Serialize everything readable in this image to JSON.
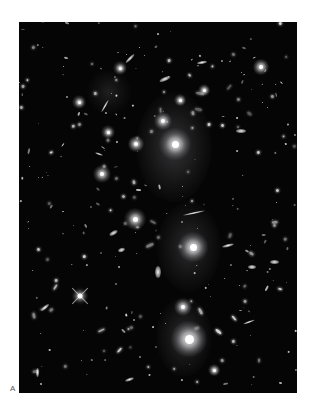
{
  "figure": {
    "panel_label": "A",
    "background_color": "#050505",
    "image_box": {
      "left": 19,
      "top": 22,
      "width": 278,
      "height": 371
    }
  },
  "diffuse_light": [
    {
      "x": 155,
      "y": 125,
      "rx": 38,
      "ry": 55,
      "opacity": 0.22
    },
    {
      "x": 170,
      "y": 225,
      "rx": 32,
      "ry": 45,
      "opacity": 0.18
    },
    {
      "x": 165,
      "y": 315,
      "rx": 28,
      "ry": 40,
      "opacity": 0.18
    },
    {
      "x": 90,
      "y": 70,
      "rx": 22,
      "ry": 22,
      "opacity": 0.12
    }
  ],
  "bright_galaxies": [
    {
      "x": 156,
      "y": 122,
      "r": 7,
      "glow": 16
    },
    {
      "x": 144,
      "y": 99,
      "r": 4,
      "glow": 9
    },
    {
      "x": 174,
      "y": 225,
      "r": 7,
      "glow": 15
    },
    {
      "x": 170,
      "y": 317,
      "r": 9,
      "glow": 18
    },
    {
      "x": 164,
      "y": 285,
      "r": 4,
      "glow": 9
    },
    {
      "x": 116,
      "y": 197,
      "r": 5,
      "glow": 11
    },
    {
      "x": 83,
      "y": 152,
      "r": 4,
      "glow": 9
    },
    {
      "x": 101,
      "y": 46,
      "r": 3,
      "glow": 7
    },
    {
      "x": 60,
      "y": 80,
      "r": 3,
      "glow": 7
    },
    {
      "x": 242,
      "y": 45,
      "r": 4,
      "glow": 8
    },
    {
      "x": 161,
      "y": 78,
      "r": 3,
      "glow": 6
    },
    {
      "x": 185,
      "y": 68,
      "r": 3,
      "glow": 6
    },
    {
      "x": 195,
      "y": 348,
      "r": 3,
      "glow": 6
    },
    {
      "x": 89,
      "y": 110,
      "r": 3,
      "glow": 7
    },
    {
      "x": 117,
      "y": 122,
      "r": 4,
      "glow": 8
    }
  ],
  "elongated_galaxies": [
    {
      "x": 146,
      "y": 57,
      "w": 12,
      "h": 4,
      "angle": -25
    },
    {
      "x": 183,
      "y": 40,
      "w": 10,
      "h": 3,
      "angle": -10
    },
    {
      "x": 111,
      "y": 36,
      "w": 12,
      "h": 3,
      "angle": -45
    },
    {
      "x": 86,
      "y": 84,
      "w": 14,
      "h": 2,
      "angle": -60
    },
    {
      "x": 222,
      "y": 109,
      "w": 10,
      "h": 4,
      "angle": 0
    },
    {
      "x": 175,
      "y": 191,
      "w": 22,
      "h": 2,
      "angle": -12
    },
    {
      "x": 139,
      "y": 250,
      "w": 6,
      "h": 12,
      "angle": 0
    },
    {
      "x": 94,
      "y": 211,
      "w": 9,
      "h": 4,
      "angle": -30
    },
    {
      "x": 209,
      "y": 223,
      "w": 12,
      "h": 3,
      "angle": -15
    },
    {
      "x": 26,
      "y": 285,
      "w": 10,
      "h": 3,
      "angle": -40
    },
    {
      "x": 230,
      "y": 300,
      "w": 12,
      "h": 2,
      "angle": -20
    },
    {
      "x": 110,
      "y": 357,
      "w": 9,
      "h": 3,
      "angle": -20
    },
    {
      "x": 233,
      "y": 245,
      "w": 8,
      "h": 4,
      "angle": 0
    },
    {
      "x": 255,
      "y": 240,
      "w": 9,
      "h": 4,
      "angle": 0
    },
    {
      "x": 102,
      "y": 228,
      "w": 7,
      "h": 4,
      "angle": -20
    },
    {
      "x": 80,
      "y": 132,
      "w": 8,
      "h": 2,
      "angle": 20
    },
    {
      "x": 18,
      "y": 350,
      "w": 3,
      "h": 9,
      "angle": 0
    }
  ],
  "spike_star": {
    "x": 61,
    "y": 274
  },
  "small_sources_seed": 7,
  "small_sources_count": 260
}
